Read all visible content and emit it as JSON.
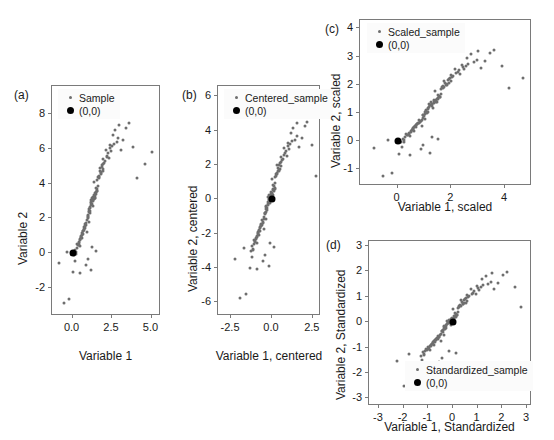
{
  "figure": {
    "background": "#ffffff",
    "sample_color": "#6e6e6e",
    "origin_color": "#000000",
    "frame_color": "#7a7a7a"
  },
  "chart_data": [
    {
      "type": "scatter",
      "panel": "(a)",
      "title": "",
      "xlabel": "Variable 1",
      "ylabel": "Variable 2",
      "xlim": [
        -1.3,
        5.6
      ],
      "ylim": [
        -3.6,
        9.6
      ],
      "xticks": [
        "0.0",
        "2.5",
        "5.0"
      ],
      "xtickvals": [
        0.0,
        2.5,
        5.0
      ],
      "yticks": [
        "-2",
        "0",
        "2",
        "4",
        "6",
        "8"
      ],
      "ytickvals": [
        -2,
        0,
        2,
        4,
        6,
        8
      ],
      "grid": false,
      "legend_position": "top-left",
      "series": [
        {
          "name": "Sample",
          "marker": "small-gray"
        },
        {
          "name": "(0,0)",
          "marker": "large-black"
        }
      ],
      "origin_point": [
        0,
        0
      ],
      "x": [
        0.9,
        1.55,
        1.1,
        1.38,
        0.62,
        1.72,
        1.2,
        0.46,
        1.02,
        1.95,
        0.3,
        1.45,
        2.1,
        0.78,
        1.3,
        0.18,
        1.62,
        0.95,
        2.35,
        1.15,
        0.55,
        1.8,
        1.05,
        0.4,
        1.5,
        2.55,
        0.85,
        1.25,
        0.68,
        1.92,
        0.12,
        1.35,
        2.2,
        0.72,
        1.58,
        0.35,
        1.75,
        1.08,
        2.7,
        1.18,
        0.58,
        1.85,
        1.12,
        0.48,
        1.42,
        2.95,
        0.92,
        1.28,
        0.75,
        2.05,
        0.22,
        1.48,
        2.4,
        0.8,
        1.65,
        0.42,
        1.88,
        1.0,
        3.2,
        1.22,
        0.65,
        2.15,
        1.32,
        0.52,
        1.52,
        3.55,
        0.98,
        1.4,
        0.82,
        2.25,
        0.28,
        1.68,
        2.6,
        0.88,
        1.78,
        0.5,
        2.0,
        1.15,
        3.85,
        1.35,
        0.7,
        2.45,
        1.45,
        0.6,
        1.6,
        4.1,
        1.05,
        1.55,
        0.95,
        2.8,
        0.38,
        1.82,
        3.05,
        1.02,
        1.95,
        0.66,
        2.3,
        1.28,
        4.6,
        1.48,
        0.25,
        2.9,
        1.7,
        0.55,
        1.9,
        5.05,
        1.12,
        2.5,
        1.38,
        3.4,
        -0.55,
        1.25,
        -0.2,
        0.85,
        0.05,
        1.5,
        0.15,
        0.95,
        -0.85,
        -0.35,
        0.45,
        1.18
      ],
      "y": [
        1.2,
        3.6,
        2.4,
        4.1,
        0.85,
        4.9,
        2.95,
        0.4,
        1.8,
        5.4,
        0.55,
        3.2,
        5.9,
        1.45,
        2.7,
        0.2,
        4.4,
        2.1,
        6.2,
        3.05,
        0.95,
        4.6,
        2.55,
        0.65,
        3.4,
        6.8,
        1.6,
        2.85,
        1.1,
        5.1,
        -0.1,
        3.1,
        5.6,
        1.35,
        4.2,
        0.45,
        4.75,
        2.3,
        7.1,
        2.9,
        1.05,
        4.95,
        2.65,
        0.75,
        3.3,
        7.35,
        1.9,
        3.0,
        1.5,
        5.3,
        0.05,
        3.5,
        6.05,
        1.7,
        4.3,
        0.6,
        5.05,
        2.2,
        6.5,
        3.15,
        1.25,
        5.5,
        3.25,
        0.9,
        3.7,
        7.45,
        2.05,
        3.15,
        1.55,
        5.75,
        0.3,
        4.45,
        6.3,
        1.75,
        4.55,
        0.8,
        5.2,
        2.75,
        6.1,
        3.35,
        1.4,
        5.85,
        3.45,
        1.15,
        3.85,
        4.3,
        2.45,
        3.55,
        2.15,
        6.4,
        0.5,
        4.65,
        5.95,
        2.35,
        4.85,
        1.3,
        5.45,
        3.05,
        5.15,
        3.75,
        -0.05,
        6.6,
        4.4,
        1.0,
        4.7,
        5.8,
        2.6,
        6.15,
        3.25,
        7.2,
        -2.85,
        0.35,
        -2.6,
        -0.65,
        -1.05,
        0.15,
        -0.45,
        -0.3,
        -0.55,
        0.1,
        -1.15,
        -0.95
      ]
    },
    {
      "type": "scatter",
      "panel": "(b)",
      "title": "",
      "xlabel": "Variable 1, centered",
      "ylabel": "Variable 2, centered",
      "xlim": [
        -3.3,
        3.0
      ],
      "ylim": [
        -6.8,
        6.6
      ],
      "xticks": [
        "-2.5",
        "0.0",
        "2.5"
      ],
      "xtickvals": [
        -2.5,
        0.0,
        2.5
      ],
      "yticks": [
        "-6",
        "-4",
        "-2",
        "0",
        "2",
        "4",
        "6"
      ],
      "ytickvals": [
        -6,
        -4,
        -2,
        0,
        2,
        4,
        6
      ],
      "grid": false,
      "legend_position": "top-left",
      "series": [
        {
          "name": "Centered_sample",
          "marker": "small-gray"
        },
        {
          "name": "(0,0)",
          "marker": "large-black"
        }
      ],
      "origin_point": [
        0,
        0
      ],
      "note": "Panel (a) data with mean subtracted from both variables"
    },
    {
      "type": "scatter",
      "panel": "(c)",
      "title": "",
      "xlabel": "Variable 1, scaled",
      "ylabel": "Variable 2, scaled",
      "xlim": [
        -1.4,
        5.0
      ],
      "ylim": [
        -1.6,
        4.3
      ],
      "xticks": [
        "0",
        "2",
        "4"
      ],
      "xtickvals": [
        0,
        2,
        4
      ],
      "yticks": [
        "-1",
        "0",
        "1",
        "2",
        "3",
        "4"
      ],
      "ytickvals": [
        -1,
        0,
        1,
        2,
        3,
        4
      ],
      "grid": false,
      "legend_position": "top-left",
      "series": [
        {
          "name": "Scaled_sample",
          "marker": "small-gray"
        },
        {
          "name": "(0,0)",
          "marker": "large-black"
        }
      ],
      "origin_point": [
        0,
        0
      ],
      "note": "Panel (a) data divided by the standard deviation of each variable"
    },
    {
      "type": "scatter",
      "panel": "(d)",
      "title": "",
      "xlabel": "Variable 1, Standardized",
      "ylabel": "Variable 2, Standardized",
      "xlim": [
        -3.4,
        3.2
      ],
      "ylim": [
        -3.3,
        3.2
      ],
      "xticks": [
        "-3",
        "-2",
        "-1",
        "0",
        "1",
        "2",
        "3"
      ],
      "xtickvals": [
        -3,
        -2,
        -1,
        0,
        1,
        2,
        3
      ],
      "yticks": [
        "-3",
        "-2",
        "-1",
        "0",
        "1",
        "2",
        "3"
      ],
      "ytickvals": [
        -3,
        -2,
        -1,
        0,
        1,
        2,
        3
      ],
      "grid": false,
      "legend_position": "bottom-center",
      "series": [
        {
          "name": "Standardized_sample",
          "marker": "small-gray"
        },
        {
          "name": "(0,0)",
          "marker": "large-black"
        }
      ],
      "origin_point": [
        0,
        0
      ],
      "note": "Panel (a) data centered and divided by standard deviation"
    }
  ]
}
